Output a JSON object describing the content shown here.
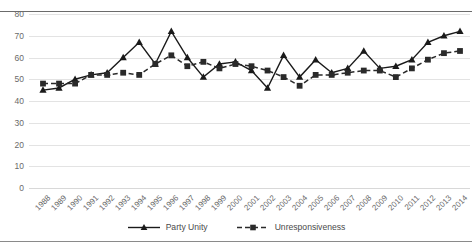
{
  "chart_data": {
    "type": "line",
    "title": "",
    "subtitle": "",
    "xlabel": "",
    "ylabel": "",
    "ylim": [
      0,
      80
    ],
    "yticks": [
      0,
      10,
      20,
      30,
      40,
      50,
      60,
      70,
      80
    ],
    "grid": true,
    "legend_position": "bottom",
    "categories": [
      "1988",
      "1989",
      "1990",
      "1991",
      "1992",
      "1993",
      "1994",
      "1995",
      "1996",
      "1997",
      "1998",
      "1999",
      "2000",
      "2001",
      "2002",
      "2003",
      "2004",
      "2005",
      "2006",
      "2007",
      "2008",
      "2009",
      "2010",
      "2011",
      "2012",
      "2013",
      "2014"
    ],
    "series": [
      {
        "name": "Party Unity",
        "marker": "triangle",
        "line_style": "solid",
        "color": "#1a1a1a",
        "values": [
          45,
          46,
          50,
          52,
          53,
          60,
          67,
          57,
          72,
          60,
          51,
          57,
          58,
          54,
          46,
          61,
          51,
          59,
          53,
          55,
          63,
          55,
          56,
          59,
          67,
          70,
          72
        ]
      },
      {
        "name": "Unresponsiveness",
        "marker": "square",
        "line_style": "dashed",
        "color": "#2a2a2a",
        "values": [
          48,
          48,
          48,
          52,
          52,
          53,
          52,
          57,
          61,
          56,
          58,
          55,
          57,
          56,
          54,
          51,
          47,
          52,
          52,
          53,
          54,
          54,
          51,
          55,
          59,
          62,
          63
        ]
      }
    ]
  },
  "legend": {
    "items": [
      {
        "label": "Party Unity"
      },
      {
        "label": "Unresponsiveness"
      }
    ]
  }
}
